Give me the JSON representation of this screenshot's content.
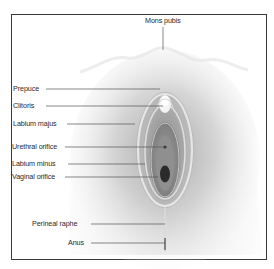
{
  "diagram": {
    "type": "anatomical-labeled-illustration",
    "labels": [
      {
        "id": "mons-pubis",
        "text": "Mons pubis"
      },
      {
        "id": "prepuce",
        "text": "Prepuce"
      },
      {
        "id": "clitoris",
        "text": "Clitoris"
      },
      {
        "id": "labium-majus",
        "text": "Labium majus"
      },
      {
        "id": "urethral-orifice",
        "text": "Urethral orifice"
      },
      {
        "id": "labium-minus",
        "text": "Labium minus"
      },
      {
        "id": "vaginal-orifice",
        "text": "Vaginal orifice"
      },
      {
        "id": "perineal-raphe",
        "text": "Perineal raphe"
      },
      {
        "id": "anus",
        "text": "Anus"
      }
    ],
    "colors": {
      "frame": "#3a3a3a",
      "leader_line": "#555555",
      "skin_shade": "#bdbdbd",
      "inner_minus": "#8c8c8c",
      "orifice": "#2b2b2b"
    }
  }
}
